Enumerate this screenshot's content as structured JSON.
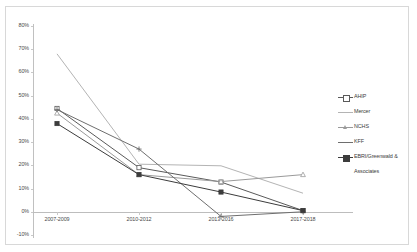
{
  "chart": {
    "title": "",
    "type": "line"
  },
  "chart_data": {
    "type": "line",
    "title": "",
    "subtitle": "",
    "xlabel": "",
    "ylabel": "",
    "categories": [
      "2007-2009",
      "2010-2012",
      "2013-2016",
      "2017-2018"
    ],
    "ylim": [
      -10,
      80
    ],
    "yticks": [
      80,
      70,
      60,
      50,
      40,
      30,
      20,
      10,
      0,
      -10
    ],
    "ytick_labels": [
      "80%",
      "70%",
      "60%",
      "50%",
      "40%",
      "30%",
      "20%",
      "10%",
      "0%",
      "-10%"
    ],
    "grid": false,
    "legend_position": "right",
    "series": [
      {
        "name": "AHIP",
        "marker": "square-open",
        "color": "#5a5a5a",
        "values": [
          44.5,
          19.0,
          12.8,
          0.5
        ]
      },
      {
        "name": "Mercer",
        "marker": "none",
        "color": "#b4b4b4",
        "values": [
          68.0,
          20.5,
          19.8,
          8.0
        ]
      },
      {
        "name": "NCHS",
        "marker": "triangle-open",
        "color": "#9a9a9a",
        "values": [
          42.5,
          16.0,
          13.0,
          16.0
        ]
      },
      {
        "name": "KFF",
        "marker": "plus",
        "color": "#6e6e6e",
        "values": [
          44.0,
          27.0,
          -2.0,
          0.0
        ]
      },
      {
        "name": "EBRI/Greenwald & Associates",
        "marker": "square-filled",
        "color": "#3c3c3c",
        "values": [
          38.0,
          16.0,
          8.5,
          0.5
        ]
      }
    ]
  },
  "legend": {
    "items": [
      {
        "label": "AHIP"
      },
      {
        "label": "Mercer"
      },
      {
        "label": "NCHS"
      },
      {
        "label": "KFF"
      },
      {
        "label": "EBRI/Greenwald &"
      },
      {
        "label": "Associates"
      }
    ]
  }
}
